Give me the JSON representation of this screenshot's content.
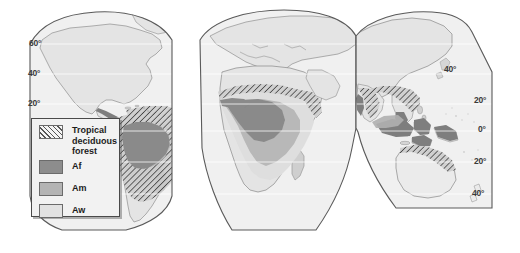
{
  "map": {
    "title": "World distribution of tropical climates (Af, Am, Aw) and tropical deciduous forest",
    "projection": "interrupted-goode-homolosine",
    "background_color": "#ffffff",
    "ocean_color": "#f0f0f0",
    "land_color": "#e2e2e2",
    "coastline_color": "#8a8a8a",
    "graticule_color": "#ffffff",
    "lobe_outline_color": "#5a5a5a",
    "latitude_labels_left": [
      {
        "label": "60°",
        "x": 29,
        "y": 40
      },
      {
        "label": "40°",
        "x": 28,
        "y": 70
      },
      {
        "label": "20°",
        "x": 28,
        "y": 100
      }
    ],
    "latitude_labels_right": [
      {
        "label": "40°",
        "x": 444,
        "y": 66
      },
      {
        "label": "20°",
        "x": 474,
        "y": 97
      },
      {
        "label": "0°",
        "x": 478,
        "y": 126
      },
      {
        "label": "20°",
        "x": 474,
        "y": 158
      },
      {
        "label": "40°",
        "x": 472,
        "y": 190
      }
    ]
  },
  "legend": {
    "title": "",
    "items": [
      {
        "id": "tropical-deciduous-forest",
        "label": "Tropical\ndeciduous\nforest",
        "pattern": "diagonal-hatch",
        "color": "#f4f4f4"
      },
      {
        "id": "af",
        "label": "Af",
        "pattern": "solid",
        "color": "#8d8d8d"
      },
      {
        "id": "am",
        "label": "Am",
        "pattern": "solid",
        "color": "#b4b4b4"
      },
      {
        "id": "aw",
        "label": "Aw",
        "pattern": "solid",
        "color": "#e2e2e2"
      }
    ]
  }
}
